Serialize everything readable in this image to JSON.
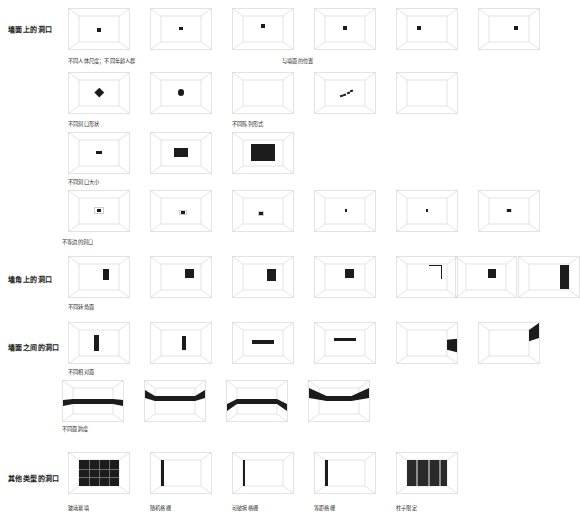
{
  "page": {
    "background": "#ffffff",
    "ink": "#1c1c1c",
    "line": "#d8d8d8"
  },
  "sections": [
    {
      "id": "wall-openings",
      "label": "墙面上的洞口",
      "label_pos": {
        "x": 8,
        "y": 24
      },
      "rows": [
        {
          "id": "row-human-scale",
          "caption": "不同人体尺度；不同年龄人群",
          "caption_pos": {
            "x": 68,
            "y": 57
          },
          "caption2": "与墙面的位置",
          "caption2_pos": {
            "x": 282,
            "y": 57
          },
          "y": 8,
          "tiles": [
            {
              "x": 68,
              "kind": "dot",
              "size": 7,
              "cx": 50,
              "cy": 55
            },
            {
              "x": 150,
              "kind": "dot",
              "size": 7,
              "cx": 50,
              "cy": 48
            },
            {
              "x": 232,
              "kind": "dot",
              "size": 7,
              "cx": 50,
              "cy": 40
            },
            {
              "x": 314,
              "kind": "dot",
              "size": 8,
              "cx": 50,
              "cy": 46
            },
            {
              "x": 396,
              "kind": "dot",
              "size": 8,
              "cx": 30,
              "cy": 46
            },
            {
              "x": 478,
              "kind": "dot",
              "size": 8,
              "cx": 68,
              "cy": 46
            }
          ]
        },
        {
          "id": "row-shape-pattern",
          "caption": "不同洞口形状",
          "caption_pos": {
            "x": 68,
            "y": 120
          },
          "caption2": "不同陈列形式",
          "caption2_pos": {
            "x": 232,
            "y": 120
          },
          "y": 72,
          "tiles": [
            {
              "x": 68,
              "kind": "diamond",
              "size": 11,
              "cx": 50,
              "cy": 48
            },
            {
              "x": 150,
              "kind": "circle",
              "size": 11,
              "cx": 50,
              "cy": 48
            },
            {
              "x": 232,
              "kind": "grid4",
              "size": 12,
              "cx": 50,
              "cy": 48
            },
            {
              "x": 314,
              "kind": "dots-diag"
            },
            {
              "x": 396,
              "kind": "bars3",
              "size": 12,
              "cx": 50,
              "cy": 48
            }
          ]
        },
        {
          "id": "row-size",
          "caption": "不同洞口大小",
          "caption_pos": {
            "x": 68,
            "y": 178
          },
          "y": 132,
          "tiles": [
            {
              "x": 68,
              "kind": "rect",
              "w": 9,
              "h": 5,
              "cx": 50,
              "cy": 48
            },
            {
              "x": 150,
              "kind": "rect",
              "w": 24,
              "h": 15,
              "cx": 50,
              "cy": 48
            },
            {
              "x": 232,
              "kind": "rect",
              "w": 40,
              "h": 26,
              "cx": 50,
              "cy": 48
            }
          ]
        },
        {
          "id": "row-asymmetric",
          "caption": "不等边的洞口",
          "caption_pos": {
            "x": 62,
            "y": 238
          },
          "y": 190,
          "tiles": [
            {
              "x": 68,
              "kind": "frame-dot",
              "frame": 16,
              "size": 6
            },
            {
              "x": 150,
              "kind": "frame-dot",
              "frame": 13,
              "size": 5,
              "ox": 2,
              "oy": 2
            },
            {
              "x": 232,
              "kind": "frame-dot",
              "frame": 11,
              "size": 5,
              "ox": -2,
              "oy": 3
            },
            {
              "x": 314,
              "kind": "dot",
              "size": 4,
              "cx": 52,
              "cy": 48
            },
            {
              "x": 396,
              "kind": "dot",
              "size": 4,
              "cx": 50,
              "cy": 48
            },
            {
              "x": 478,
              "kind": "frame-dot",
              "frame": 9,
              "size": 5
            }
          ]
        }
      ]
    },
    {
      "id": "corner-openings",
      "label": "墙角上的洞口",
      "label_pos": {
        "x": 8,
        "y": 274
      },
      "rows": [
        {
          "id": "row-corner-faces",
          "caption": "不同转角面",
          "caption_pos": {
            "x": 68,
            "y": 303
          },
          "y": 256,
          "tiles": [
            {
              "x": 68,
              "kind": "corner-right",
              "w": 9,
              "h": 19
            },
            {
              "x": 150,
              "kind": "corner-right",
              "w": 15,
              "h": 15
            },
            {
              "x": 232,
              "kind": "corner-right",
              "w": 15,
              "h": 20,
              "rightedge": true
            },
            {
              "x": 314,
              "kind": "corner-right",
              "w": 15,
              "h": 15,
              "ox": -4
            },
            {
              "x": 396,
              "kind": "corner-hook"
            },
            {
              "x": 455,
              "kind": "corner-right",
              "w": 13,
              "h": 15,
              "ox": -2
            },
            {
              "x": 518,
              "kind": "corner-edge-tall"
            }
          ]
        }
      ]
    },
    {
      "id": "between-walls",
      "label": "墙面之间的洞口",
      "label_pos": {
        "x": 8,
        "y": 342
      },
      "rows": [
        {
          "id": "row-opposite-faces",
          "caption": "不同相对面",
          "caption_pos": {
            "x": 68,
            "y": 368
          },
          "y": 322,
          "tiles": [
            {
              "x": 68,
              "kind": "vbar",
              "w": 7,
              "h": 26,
              "cx": 44
            },
            {
              "x": 150,
              "kind": "vbar",
              "w": 7,
              "h": 22,
              "cx": 58
            },
            {
              "x": 232,
              "kind": "hbar",
              "w": 34,
              "h": 6,
              "cy": 45
            },
            {
              "x": 314,
              "kind": "hbar",
              "w": 34,
              "h": 5,
              "cy": 38
            },
            {
              "x": 396,
              "kind": "side-wedge"
            },
            {
              "x": 478,
              "kind": "side-wedge-top"
            }
          ]
        },
        {
          "id": "row-span",
          "caption": "不同面跨度",
          "caption_pos": {
            "x": 62,
            "y": 425
          },
          "y": 380,
          "tiles": [
            {
              "x": 62,
              "kind": "span",
              "variant": "flat"
            },
            {
              "x": 144,
              "kind": "span",
              "variant": "high"
            },
            {
              "x": 226,
              "kind": "span",
              "variant": "mid"
            },
            {
              "x": 308,
              "kind": "span",
              "variant": "curve"
            }
          ]
        }
      ]
    },
    {
      "id": "other-types",
      "label": "其他类型的洞口",
      "label_pos": {
        "x": 8,
        "y": 473
      },
      "rows": [
        {
          "id": "row-other",
          "y": 452,
          "tiles": [
            {
              "x": 68,
              "kind": "curtain-wall",
              "caption": "玻璃幕墙",
              "caption_pos": {
                "x": 68,
                "y": 504
              }
            },
            {
              "x": 150,
              "kind": "grille-random",
              "caption": "随机格栅",
              "caption_pos": {
                "x": 150,
                "y": 504
              }
            },
            {
              "x": 232,
              "kind": "grille-break",
              "caption": "可破拆格栅",
              "caption_pos": {
                "x": 232,
                "y": 504
              }
            },
            {
              "x": 314,
              "kind": "grille-even",
              "caption": "等距格栅",
              "caption_pos": {
                "x": 314,
                "y": 504
              }
            },
            {
              "x": 396,
              "kind": "columns",
              "caption": "柱子限定",
              "caption_pos": {
                "x": 396,
                "y": 504
              }
            }
          ]
        }
      ]
    }
  ]
}
